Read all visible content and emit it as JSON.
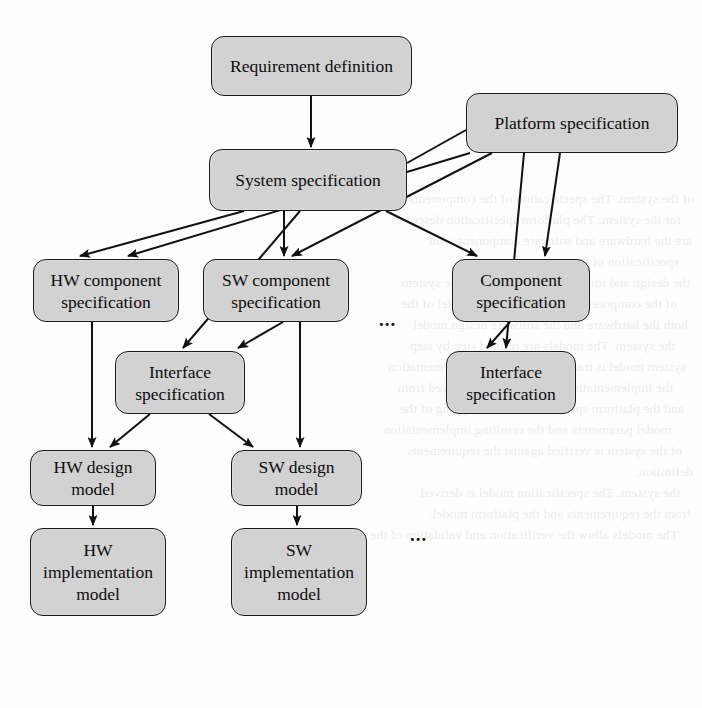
{
  "diagram": {
    "canvas": {
      "width": 702,
      "height": 708
    },
    "style": {
      "node_fill": "#d2d2d2",
      "node_stroke": "#1a1a1a",
      "edge_stroke": "#111111",
      "background": "#fdfdfd",
      "text_color": "#0d0d0d"
    },
    "nodes": [
      {
        "id": "requirement_definition",
        "label": "Requirement definition",
        "x": 211,
        "y": 36,
        "w": 201,
        "h": 60
      },
      {
        "id": "platform_specification",
        "label": "Platform specification",
        "x": 466,
        "y": 93,
        "w": 212,
        "h": 60
      },
      {
        "id": "system_specification",
        "label": "System specification",
        "x": 209,
        "y": 149,
        "w": 198,
        "h": 62
      },
      {
        "id": "hw_component_spec",
        "label": "HW component\nspecification",
        "x": 33,
        "y": 259,
        "w": 146,
        "h": 63
      },
      {
        "id": "sw_component_spec",
        "label": "SW component\nspecification",
        "x": 203,
        "y": 259,
        "w": 146,
        "h": 63
      },
      {
        "id": "component_spec",
        "label": "Component\nspecification",
        "x": 452,
        "y": 259,
        "w": 138,
        "h": 63
      },
      {
        "id": "interface_spec_mid",
        "label": "Interface\nspecification",
        "x": 115,
        "y": 351,
        "w": 130,
        "h": 63
      },
      {
        "id": "interface_spec_right",
        "label": "Interface\nspecification",
        "x": 446,
        "y": 351,
        "w": 130,
        "h": 63
      },
      {
        "id": "hw_design_model",
        "label": "HW design\nmodel",
        "x": 30,
        "y": 450,
        "w": 126,
        "h": 56
      },
      {
        "id": "sw_design_model",
        "label": "SW design\nmodel",
        "x": 231,
        "y": 450,
        "w": 131,
        "h": 56
      },
      {
        "id": "hw_implementation_model",
        "label": "HW\nimplementation\nmodel",
        "x": 30,
        "y": 528,
        "w": 136,
        "h": 88
      },
      {
        "id": "sw_implementation_model",
        "label": "SW\nimplementation\nmodel",
        "x": 231,
        "y": 528,
        "w": 136,
        "h": 88
      }
    ],
    "ellipses": [
      {
        "id": "ellipsis-component-row",
        "label": "...",
        "x": 379,
        "y": 315
      },
      {
        "id": "ellipsis-design-row",
        "label": "...",
        "x": 410,
        "y": 530
      }
    ],
    "edges": [
      {
        "id": "req-to-system",
        "from": "requirement_definition",
        "to": "system_specification"
      },
      {
        "id": "platform-to-hw-comp",
        "from": "platform_specification",
        "to": "hw_component_spec"
      },
      {
        "id": "platform-to-sw-comp",
        "from": "platform_specification",
        "to": "sw_component_spec"
      },
      {
        "id": "platform-to-component",
        "from": "platform_specification",
        "to": "component_spec"
      },
      {
        "id": "platform-to-system",
        "from": "platform_specification",
        "to": "system_specification"
      },
      {
        "id": "system-to-hw-comp",
        "from": "system_specification",
        "to": "hw_component_spec"
      },
      {
        "id": "system-to-sw-comp",
        "from": "system_specification",
        "to": "sw_component_spec"
      },
      {
        "id": "system-to-component",
        "from": "system_specification",
        "to": "component_spec"
      },
      {
        "id": "system-to-interface-mid",
        "from": "system_specification",
        "to": "interface_spec_mid"
      },
      {
        "id": "sw-comp-to-interface-mid",
        "from": "sw_component_spec",
        "to": "interface_spec_mid"
      },
      {
        "id": "component-to-interface-right",
        "from": "component_spec",
        "to": "interface_spec_right"
      },
      {
        "id": "platform-to-interface-right",
        "from": "platform_specification",
        "to": "interface_spec_right"
      },
      {
        "id": "hw-comp-to-hw-design",
        "from": "hw_component_spec",
        "to": "hw_design_model"
      },
      {
        "id": "sw-comp-to-sw-design",
        "from": "sw_component_spec",
        "to": "sw_design_model"
      },
      {
        "id": "interface-mid-to-hw-design",
        "from": "interface_spec_mid",
        "to": "hw_design_model"
      },
      {
        "id": "interface-mid-to-sw-design",
        "from": "interface_spec_mid",
        "to": "sw_design_model"
      },
      {
        "id": "hw-design-to-hw-impl",
        "from": "hw_design_model",
        "to": "hw_implementation_model"
      },
      {
        "id": "sw-design-to-sw-impl",
        "from": "sw_design_model",
        "to": "sw_implementation_model"
      }
    ]
  },
  "background_text": {
    "lines": [
      "of the system. The specification of the components is",
      "for the system. The platform specification describes",
      "are the hardware and software components and",
      "specification of the system.",
      "the design and implementation model of the system",
      "of the component specification. The model of the",
      "both the hardware and the software design model",
      "the system. The models are refined step by step",
      "system model is transformed into the implementation",
      "the implementation of the system is derived from",
      "and the platform specification. The mapping of the",
      "model parameters and the resulting implementation",
      "of the system is verified against the requirements",
      "definition.",
      "the system. The specification model is derived",
      "from the requirements and the platform model.",
      "The models allow the verification and validation of the"
    ]
  }
}
